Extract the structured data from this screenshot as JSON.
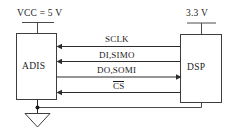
{
  "diagram": {
    "colors": {
      "wire": "#4a4a4a",
      "wire_dark": "#2b2b2b",
      "box_stroke": "#3d3d3d",
      "text": "#1c1c1c",
      "background": "#ffffff"
    },
    "supplies": [
      {
        "id": "vcc",
        "label": "VCC = 5 V",
        "attached_to": "ADIS"
      },
      {
        "id": "vdd",
        "label": "3.3 V",
        "attached_to": "DSP"
      }
    ],
    "blocks": [
      {
        "id": "adis",
        "label": "ADIS"
      },
      {
        "id": "dsp",
        "label": "DSP"
      }
    ],
    "signals": [
      {
        "id": "sclk",
        "label": "SCLK",
        "overline": false,
        "direction": "dsp-to-adis"
      },
      {
        "id": "di_simo",
        "label": "DI,SIMO",
        "overline": false,
        "direction": "dsp-to-adis"
      },
      {
        "id": "do_somi",
        "label": "DO,SOMI",
        "overline": false,
        "direction": "adis-to-dsp"
      },
      {
        "id": "cs",
        "label": "CS",
        "overline": true,
        "direction": "dsp-to-adis"
      }
    ],
    "ground": {
      "id": "gnd",
      "label": "",
      "symbol": "ground-triangle"
    }
  }
}
